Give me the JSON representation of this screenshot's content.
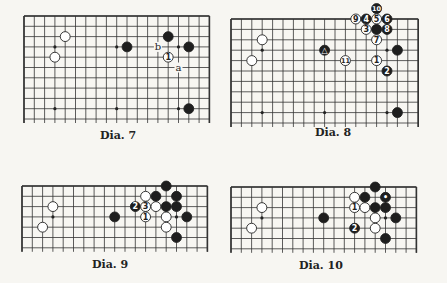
{
  "colors": {
    "background": "#f7f6f2",
    "grid": "#333333",
    "black_stone": "#1e1e1e",
    "white_stone": "#ffffff"
  },
  "diagrams": [
    {
      "caption": "Dia. 7",
      "board": {
        "x": 24,
        "y": 16,
        "cols": 18,
        "rows": 10,
        "cell": 10.3,
        "open_bottom": true
      },
      "hoshi": [
        [
          3,
          3
        ],
        [
          9,
          3
        ],
        [
          15,
          3
        ],
        [
          3,
          9
        ],
        [
          9,
          9
        ],
        [
          15,
          9
        ]
      ],
      "stones": [
        {
          "c": 4,
          "r": 2,
          "color": "white",
          "label": ""
        },
        {
          "c": 3,
          "r": 4,
          "color": "white",
          "label": ""
        },
        {
          "c": 10,
          "r": 3,
          "color": "black",
          "label": ""
        },
        {
          "c": 14,
          "r": 2,
          "color": "black",
          "label": ""
        },
        {
          "c": 16,
          "r": 3,
          "color": "black",
          "label": ""
        },
        {
          "c": 14,
          "r": 4,
          "color": "white",
          "label": "1"
        },
        {
          "c": 16,
          "r": 9,
          "color": "black",
          "label": ""
        }
      ],
      "marks": [
        {
          "c": 13,
          "r": 3,
          "text": "b"
        },
        {
          "c": 15,
          "r": 5,
          "text": "a"
        }
      ]
    },
    {
      "caption": "Dia. 8",
      "board": {
        "x": 231,
        "y": 19,
        "cols": 18,
        "rows": 10,
        "cell": 10.4,
        "open_bottom": true
      },
      "hoshi": [
        [
          3,
          3
        ],
        [
          9,
          3
        ],
        [
          15,
          3
        ],
        [
          3,
          9
        ],
        [
          9,
          9
        ],
        [
          15,
          9
        ]
      ],
      "stones": [
        {
          "c": 3,
          "r": 2,
          "color": "white",
          "label": ""
        },
        {
          "c": 2,
          "r": 4,
          "color": "white",
          "label": ""
        },
        {
          "c": 9,
          "r": 3,
          "color": "black",
          "label": "△"
        },
        {
          "c": 14,
          "r": -1,
          "color": "black",
          "label": "10"
        },
        {
          "c": 12,
          "r": 0,
          "color": "white",
          "label": "9"
        },
        {
          "c": 13,
          "r": 0,
          "color": "black",
          "label": "4"
        },
        {
          "c": 14,
          "r": 0,
          "color": "white",
          "label": "5"
        },
        {
          "c": 15,
          "r": 0,
          "color": "black",
          "label": "6"
        },
        {
          "c": 13,
          "r": 1,
          "color": "white",
          "label": "3"
        },
        {
          "c": 14,
          "r": 1,
          "color": "black",
          "label": ""
        },
        {
          "c": 15,
          "r": 1,
          "color": "black",
          "label": "8"
        },
        {
          "c": 14,
          "r": 2,
          "color": "white",
          "label": "7"
        },
        {
          "c": 16,
          "r": 3,
          "color": "black",
          "label": ""
        },
        {
          "c": 11,
          "r": 4,
          "color": "white",
          "label": "11"
        },
        {
          "c": 14,
          "r": 4,
          "color": "white",
          "label": "1"
        },
        {
          "c": 15,
          "r": 5,
          "color": "black",
          "label": "2"
        },
        {
          "c": 16,
          "r": 9,
          "color": "black",
          "label": ""
        }
      ],
      "marks": []
    },
    {
      "caption": "Dia. 9",
      "board": {
        "x": 22,
        "y": 186,
        "cols": 18,
        "rows": 6,
        "cell": 10.3,
        "open_bottom": true
      },
      "hoshi": [
        [
          3,
          3
        ],
        [
          9,
          3
        ],
        [
          15,
          3
        ]
      ],
      "stones": [
        {
          "c": 3,
          "r": 2,
          "color": "white",
          "label": ""
        },
        {
          "c": 2,
          "r": 4,
          "color": "white",
          "label": ""
        },
        {
          "c": 9,
          "r": 3,
          "color": "black",
          "label": ""
        },
        {
          "c": 14,
          "r": 0,
          "color": "black",
          "label": ""
        },
        {
          "c": 12,
          "r": 1,
          "color": "white",
          "label": ""
        },
        {
          "c": 13,
          "r": 1,
          "color": "black",
          "label": ""
        },
        {
          "c": 15,
          "r": 1,
          "color": "black",
          "label": ""
        },
        {
          "c": 11,
          "r": 2,
          "color": "black",
          "label": "2"
        },
        {
          "c": 12,
          "r": 2,
          "color": "white",
          "label": "3"
        },
        {
          "c": 13,
          "r": 2,
          "color": "white",
          "label": ""
        },
        {
          "c": 14,
          "r": 2,
          "color": "black",
          "label": ""
        },
        {
          "c": 15,
          "r": 2,
          "color": "black",
          "label": ""
        },
        {
          "c": 12,
          "r": 3,
          "color": "white",
          "label": "1"
        },
        {
          "c": 14,
          "r": 3,
          "color": "white",
          "label": ""
        },
        {
          "c": 16,
          "r": 3,
          "color": "black",
          "label": ""
        },
        {
          "c": 14,
          "r": 4,
          "color": "white",
          "label": ""
        },
        {
          "c": 15,
          "r": 5,
          "color": "black",
          "label": ""
        }
      ],
      "marks": []
    },
    {
      "caption": "Dia. 10",
      "board": {
        "x": 231,
        "y": 187,
        "cols": 18,
        "rows": 6,
        "cell": 10.3,
        "open_bottom": true
      },
      "hoshi": [
        [
          3,
          3
        ],
        [
          9,
          3
        ],
        [
          15,
          3
        ]
      ],
      "stones": [
        {
          "c": 3,
          "r": 2,
          "color": "white",
          "label": ""
        },
        {
          "c": 2,
          "r": 4,
          "color": "white",
          "label": ""
        },
        {
          "c": 9,
          "r": 3,
          "color": "black",
          "label": ""
        },
        {
          "c": 14,
          "r": 0,
          "color": "black",
          "label": ""
        },
        {
          "c": 12,
          "r": 1,
          "color": "white",
          "label": ""
        },
        {
          "c": 13,
          "r": 1,
          "color": "black",
          "label": ""
        },
        {
          "c": 15,
          "r": 1,
          "color": "black",
          "label": "•"
        },
        {
          "c": 12,
          "r": 2,
          "color": "white",
          "label": "1"
        },
        {
          "c": 13,
          "r": 2,
          "color": "white",
          "label": ""
        },
        {
          "c": 14,
          "r": 2,
          "color": "black",
          "label": ""
        },
        {
          "c": 15,
          "r": 2,
          "color": "black",
          "label": ""
        },
        {
          "c": 14,
          "r": 3,
          "color": "white",
          "label": ""
        },
        {
          "c": 16,
          "r": 3,
          "color": "black",
          "label": ""
        },
        {
          "c": 12,
          "r": 4,
          "color": "black",
          "label": "2"
        },
        {
          "c": 14,
          "r": 4,
          "color": "white",
          "label": ""
        },
        {
          "c": 15,
          "r": 5,
          "color": "black",
          "label": ""
        }
      ],
      "marks": []
    }
  ],
  "captions_pos": [
    {
      "x": 100,
      "y": 129
    },
    {
      "x": 315,
      "y": 126
    },
    {
      "x": 92,
      "y": 258
    },
    {
      "x": 299,
      "y": 259
    }
  ]
}
